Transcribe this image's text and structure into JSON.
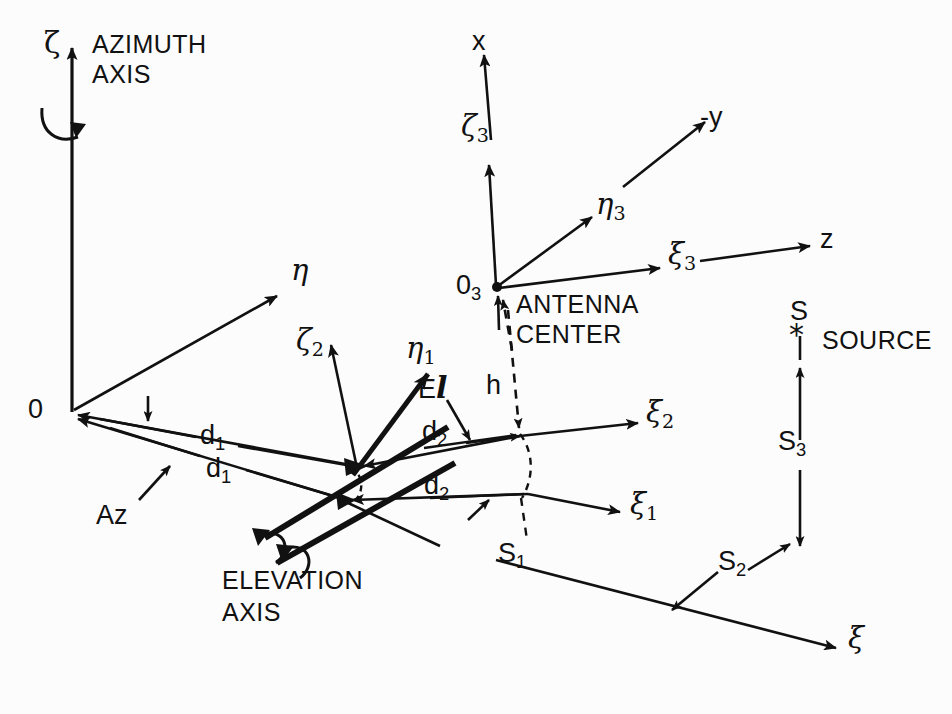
{
  "figure": {
    "kind": "antenna-pointing-coordinate-diagram",
    "background_color": "#fcfcfc",
    "ink_color": "#111111"
  },
  "labels": {
    "azimuth_axis_line1": "AZIMUTH",
    "azimuth_axis_line2": "AXIS",
    "elevation_axis_line1": "ELEVATION",
    "elevation_axis_line2": "AXIS",
    "antenna_center_line1": "ANTENNA",
    "antenna_center_line2": "CENTER",
    "source": "SOURCE",
    "az": "Az",
    "el_prefix": "E",
    "el_script": "l",
    "h": "h",
    "origin": "0"
  },
  "axes": {
    "zeta": "ζ",
    "eta": "η",
    "xi": "ξ",
    "zeta_2": "ζ",
    "zeta_2_sub": "2",
    "eta_1": "η",
    "eta_1_sub": "1",
    "xi_1": "ξ",
    "xi_1_sub": "1",
    "xi_2": "ξ",
    "xi_2_sub": "2",
    "zeta_3": "ζ",
    "zeta_3_sub": "3",
    "eta_3": "η",
    "eta_3_sub": "3",
    "xi_3": "ξ",
    "xi_3_sub": "3",
    "x": "x",
    "minus_y": "-y",
    "z": "z",
    "o3": "0",
    "o3_sub": "3"
  },
  "vectors": {
    "d1_upper": "d",
    "d1_upper_sub": "1",
    "d1_lower": "d",
    "d1_lower_sub": "1",
    "d2_upper": "d",
    "d2_upper_sub": "2",
    "d2_lower": "d",
    "d2_lower_sub": "2",
    "s1": "S",
    "s1_sub": "1",
    "s2": "S",
    "s2_sub": "2",
    "s3": "S",
    "s3_sub": "3",
    "s_star": "S"
  }
}
